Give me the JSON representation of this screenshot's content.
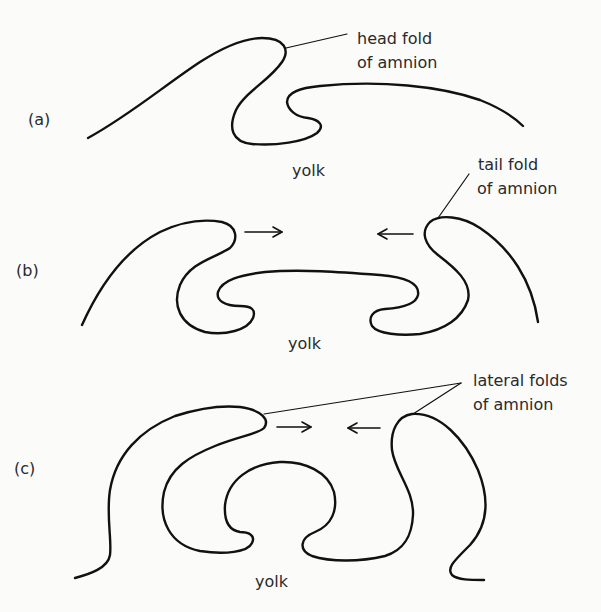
{
  "figure": {
    "panels": [
      {
        "id": "a",
        "label": "(a)",
        "yolk_label": "yolk",
        "annotation": {
          "line1": "head fold",
          "line2": "of amnion"
        }
      },
      {
        "id": "b",
        "label": "(b)",
        "yolk_label": "yolk",
        "annotation": {
          "line1": "tail fold",
          "line2": "of amnion"
        },
        "arrows": [
          "right-arrow",
          "left-arrow"
        ]
      },
      {
        "id": "c",
        "label": "(c)",
        "yolk_label": "yolk",
        "annotation": {
          "line1": "lateral folds",
          "line2": "of amnion"
        },
        "arrows": [
          "right-arrow",
          "left-arrow"
        ]
      }
    ],
    "colors": {
      "ink": "#111111",
      "background": "#fbfbfa",
      "text": "#2a2a2a"
    }
  }
}
